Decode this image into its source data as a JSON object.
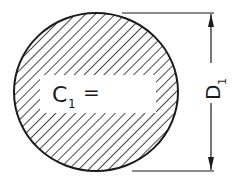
{
  "diagram": {
    "shape": "circle",
    "fill_pattern": "diagonal-hatch",
    "stroke_color": "#1a1a1a",
    "background_color": "#ffffff",
    "label": {
      "symbol": "C",
      "subscript": "1",
      "operator": "="
    },
    "dimension": {
      "symbol": "D",
      "subscript": "1",
      "orientation": "vertical"
    }
  }
}
